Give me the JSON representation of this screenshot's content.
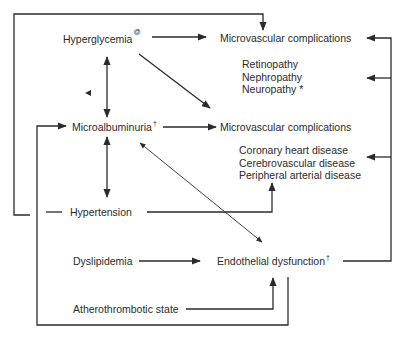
{
  "diagram": {
    "type": "flow",
    "colors": {
      "line": "#2b2b2b",
      "text": "#2b2b2b",
      "background": "#ffffff"
    },
    "nodes": {
      "hyperglycemia": {
        "label": "Hyperglycemia",
        "sup": "@"
      },
      "microvascular_1": {
        "label": "Microvascular complications",
        "sup": ""
      },
      "microvascular_list": {
        "items": [
          "Retinopathy",
          "Nephropathy",
          "Neuropathy *"
        ]
      },
      "microalbuminuria": {
        "label": "Microalbuminuria",
        "sup": "†"
      },
      "microvascular_2": {
        "label": "Microvascular complications",
        "sup": ""
      },
      "macrovascular_list": {
        "items": [
          "Coronary heart disease",
          "Cerebrovascular disease",
          "Peripheral arterial disease"
        ]
      },
      "hypertension": {
        "label": "Hypertension",
        "sup": ""
      },
      "dyslipidemia": {
        "label": "Dyslipidemia",
        "sup": ""
      },
      "endothelial": {
        "label": "Endothelial dysfunction",
        "sup": "†"
      },
      "atherothrombotic": {
        "label": "Atherothrombotic state",
        "sup": ""
      }
    },
    "edges": [
      {
        "from": "Hyperglycemia",
        "to": "Microvascular complications (top)",
        "kind": "arrow"
      },
      {
        "from": "Hyperglycemia",
        "to": "Microvascular complications (middle)",
        "kind": "arrow"
      },
      {
        "from": "Hyperglycemia",
        "to": "Microalbuminuria",
        "kind": "bidirectional"
      },
      {
        "from": "Microalbuminuria",
        "to": "Microvascular complications (middle)",
        "kind": "arrow"
      },
      {
        "from": "Microalbuminuria",
        "to": "Hypertension",
        "kind": "bidirectional"
      },
      {
        "from": "Microalbuminuria",
        "to": "Endothelial dysfunction",
        "kind": "bidirectional"
      },
      {
        "from": "Hypertension",
        "to": "Macrovascular diseases",
        "kind": "elbow-arrow"
      },
      {
        "from": "Hypertension",
        "to": "Microvascular complications (top)",
        "kind": "loop-arrow"
      },
      {
        "from": "Dyslipidemia",
        "to": "Endothelial dysfunction",
        "kind": "arrow"
      },
      {
        "from": "Atherothrombotic state",
        "to": "Endothelial dysfunction",
        "kind": "elbow-arrow"
      },
      {
        "from": "Endothelial dysfunction",
        "to": "Microalbuminuria",
        "kind": "loop-arrow"
      },
      {
        "from": "Endothelial dysfunction",
        "to": "Microvascular complications / Retinopathy list / Macrovascular list",
        "kind": "loop-arrow"
      }
    ]
  }
}
